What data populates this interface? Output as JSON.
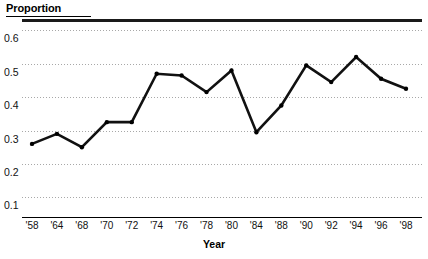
{
  "chart_data": {
    "type": "line",
    "title": "",
    "xlabel": "Year",
    "ylabel": "Proportion",
    "categories": [
      "'58",
      "'64",
      "'68",
      "'70",
      "'72",
      "'74",
      "'76",
      "'78",
      "'80",
      "'84",
      "'88",
      "'90",
      "'92",
      "'94",
      "'96",
      "'98"
    ],
    "values": [
      0.26,
      0.29,
      0.25,
      0.325,
      0.325,
      0.47,
      0.465,
      0.415,
      0.48,
      0.295,
      0.375,
      0.495,
      0.445,
      0.52,
      0.455,
      0.425
    ],
    "ylim": [
      0.05,
      0.625
    ],
    "ytick_values": [
      0.6,
      0.5,
      0.4,
      0.3,
      0.2,
      0.1
    ],
    "ytick_labels": [
      "0.6",
      "0.5",
      "0.4",
      "0.3",
      "0.2",
      "0.1"
    ],
    "grid": true,
    "grid_axis": "y",
    "grid_style": "dotted",
    "legend": "none",
    "markers": true,
    "line_color": "#111111",
    "marker_color": "#000000",
    "grid_color": "#a8a8a8",
    "axis_color": "#000000"
  },
  "axes": {
    "y_title": "Proportion",
    "x_title": "Year"
  }
}
